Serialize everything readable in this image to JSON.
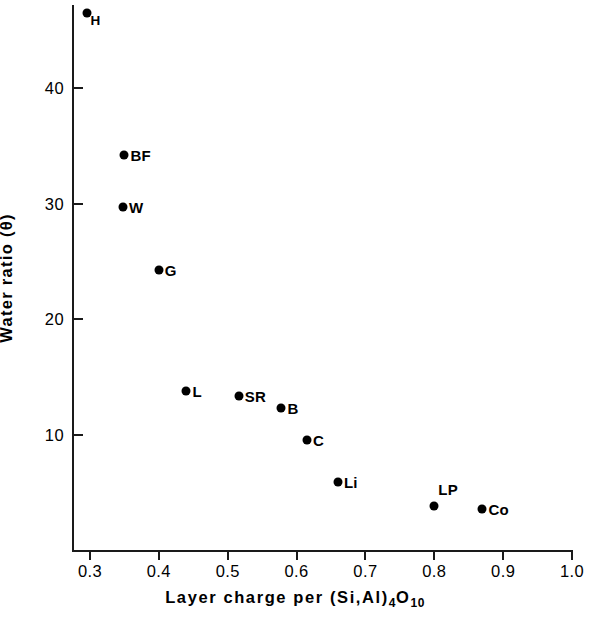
{
  "chart_data": {
    "type": "scatter",
    "title": "",
    "xlabel": "Layer charge per (Si,Al)4O10",
    "xlabel_parts": {
      "lead": "Layer charge  per  (Si,Al)",
      "sub1": "4",
      "mid": "O",
      "sub2": "10"
    },
    "ylabel": "Water ratio (θ)",
    "xlim": [
      0.3,
      1.0
    ],
    "ylim": [
      0,
      48.5
    ],
    "xticks": [
      "0.3",
      "0.4",
      "0.5",
      "0.6",
      "0.7",
      "0.8",
      "0.9",
      "1.0"
    ],
    "xtick_values": [
      0.3,
      0.4,
      0.5,
      0.6,
      0.7,
      0.8,
      0.9,
      1.0
    ],
    "yticks": [
      "40",
      "30",
      "20",
      "10"
    ],
    "ytick_values": [
      40,
      30,
      20,
      10
    ],
    "grid": false,
    "legend": false,
    "marker_color": "#000000",
    "axis_color": "#1a1a1a",
    "points": [
      {
        "label": "H",
        "x": 0.295,
        "y": 46.5,
        "label_pos": "belowright"
      },
      {
        "label": "BF",
        "x": 0.35,
        "y": 34.2,
        "label_pos": "right"
      },
      {
        "label": "W",
        "x": 0.348,
        "y": 29.7,
        "label_pos": "right"
      },
      {
        "label": "G",
        "x": 0.4,
        "y": 24.3,
        "label_pos": "right"
      },
      {
        "label": "L",
        "x": 0.44,
        "y": 13.8,
        "label_pos": "right"
      },
      {
        "label": "SR",
        "x": 0.516,
        "y": 13.4,
        "label_pos": "right"
      },
      {
        "label": "B",
        "x": 0.578,
        "y": 12.3,
        "label_pos": "right"
      },
      {
        "label": "C",
        "x": 0.615,
        "y": 9.6,
        "label_pos": "right"
      },
      {
        "label": "Li",
        "x": 0.66,
        "y": 5.9,
        "label_pos": "right"
      },
      {
        "label": "LP",
        "x": 0.8,
        "y": 3.9,
        "label_pos": "aboveright"
      },
      {
        "label": "Co",
        "x": 0.87,
        "y": 3.6,
        "label_pos": "right"
      }
    ]
  }
}
